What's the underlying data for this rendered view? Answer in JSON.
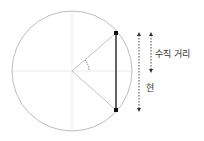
{
  "diagram": {
    "labels": {
      "perpendicular_distance": "수직 거리",
      "chord": "현"
    },
    "colors": {
      "circle": "#bdbdbd",
      "axes": "#e0e0e0",
      "radius": "#bdbdbd",
      "chord": "#222222",
      "arrows": "#333333"
    }
  }
}
